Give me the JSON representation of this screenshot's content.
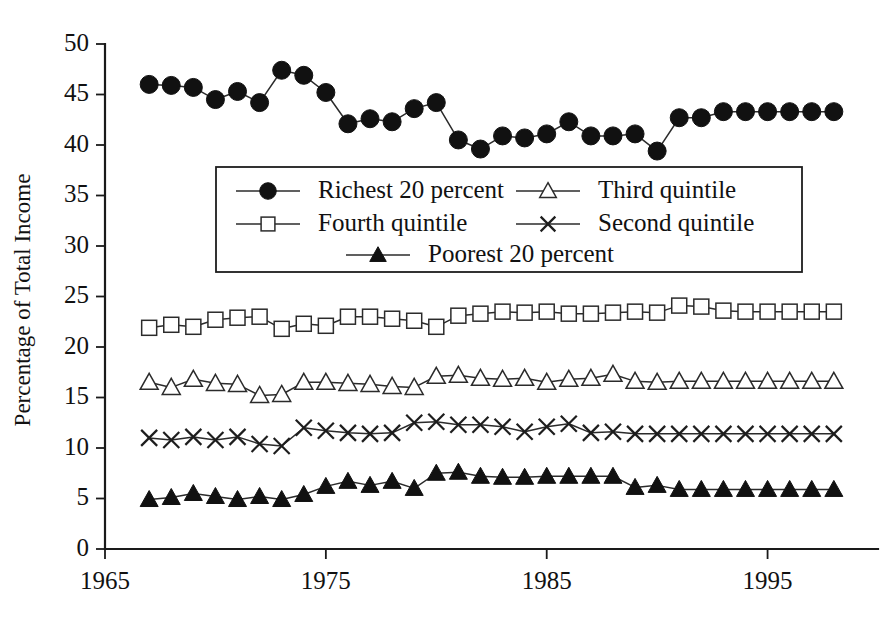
{
  "chart_data": {
    "type": "line",
    "title": "",
    "subtitle": "",
    "xlabel": "",
    "ylabel": "Percentage of Total Income",
    "xlim": [
      1965,
      2000
    ],
    "ylim": [
      0,
      50
    ],
    "ytick_step": 5,
    "yticks": [
      0,
      5,
      10,
      15,
      20,
      25,
      30,
      35,
      40,
      45,
      50
    ],
    "ytick_labels": [
      "0",
      "5",
      "10",
      "15",
      "20",
      "25",
      "30",
      "35",
      "40",
      "45",
      "50"
    ],
    "xticks": [
      1965,
      1975,
      1985,
      1995
    ],
    "xtick_labels": [
      "1965",
      "1975",
      "1985",
      "1995"
    ],
    "grid": false,
    "legend_position": "upper-center-inside",
    "x": [
      1967,
      1968,
      1969,
      1970,
      1971,
      1972,
      1973,
      1974,
      1975,
      1976,
      1977,
      1978,
      1979,
      1980,
      1981,
      1982,
      1983,
      1984,
      1985,
      1986,
      1987,
      1988,
      1989,
      1990,
      1991,
      1992,
      1993,
      1994,
      1995,
      1996,
      1997,
      1998
    ],
    "series": [
      {
        "name": "Richest 20 percent",
        "marker": "filled-circle",
        "values": [
          46.0,
          45.9,
          45.7,
          44.5,
          45.3,
          44.2,
          47.4,
          46.9,
          45.2,
          42.1,
          42.6,
          42.3,
          43.6,
          44.2,
          40.5,
          39.6,
          40.9,
          40.7,
          41.1,
          42.3,
          40.9,
          40.9,
          41.1,
          39.4,
          42.7,
          42.7,
          43.3,
          43.3,
          43.3,
          43.3,
          43.3,
          43.3
        ]
      },
      {
        "name": "Fourth quintile",
        "marker": "open-square",
        "values": [
          21.9,
          22.2,
          22.0,
          22.7,
          22.9,
          23.0,
          21.8,
          22.3,
          22.1,
          23.0,
          23.0,
          22.8,
          22.6,
          22.0,
          23.1,
          23.3,
          23.5,
          23.4,
          23.5,
          23.3,
          23.3,
          23.4,
          23.5,
          23.4,
          24.1,
          24.0,
          23.6,
          23.5,
          23.5,
          23.5,
          23.5,
          23.5
        ]
      },
      {
        "name": "Third quintile",
        "marker": "open-triangle",
        "values": [
          16.5,
          16.0,
          16.8,
          16.4,
          16.3,
          15.2,
          15.3,
          16.5,
          16.5,
          16.4,
          16.3,
          16.1,
          16.0,
          17.1,
          17.2,
          16.9,
          16.8,
          16.9,
          16.5,
          16.8,
          16.9,
          17.3,
          16.6,
          16.5,
          16.6,
          16.6,
          16.6,
          16.6,
          16.6,
          16.6,
          16.6,
          16.6
        ]
      },
      {
        "name": "Second quintile",
        "marker": "cross",
        "values": [
          11.0,
          10.8,
          11.1,
          10.8,
          11.1,
          10.4,
          10.2,
          12.0,
          11.7,
          11.5,
          11.4,
          11.5,
          12.5,
          12.6,
          12.3,
          12.3,
          12.1,
          11.6,
          12.1,
          12.4,
          11.5,
          11.6,
          11.4,
          11.4,
          11.4,
          11.4,
          11.4,
          11.4,
          11.4,
          11.4,
          11.4,
          11.4
        ]
      },
      {
        "name": "Poorest 20 percent",
        "marker": "filled-triangle",
        "values": [
          4.9,
          5.1,
          5.5,
          5.2,
          4.9,
          5.2,
          4.9,
          5.4,
          6.2,
          6.7,
          6.3,
          6.7,
          6.0,
          7.5,
          7.6,
          7.2,
          7.1,
          7.1,
          7.2,
          7.2,
          7.2,
          7.2,
          6.1,
          6.3,
          5.9,
          5.9,
          5.9,
          5.9,
          5.9,
          5.9,
          5.9,
          5.9
        ]
      }
    ]
  },
  "legend": {
    "entries": [
      {
        "label": "Richest 20 percent",
        "marker": "filled-circle"
      },
      {
        "label": "Third quintile",
        "marker": "open-triangle"
      },
      {
        "label": "Fourth quintile",
        "marker": "open-square"
      },
      {
        "label": "Second quintile",
        "marker": "cross"
      },
      {
        "label": "Poorest 20 percent",
        "marker": "filled-triangle"
      }
    ]
  },
  "colors": {
    "ink": "#111111",
    "line": "#2b2b2b",
    "background": "#ffffff"
  }
}
